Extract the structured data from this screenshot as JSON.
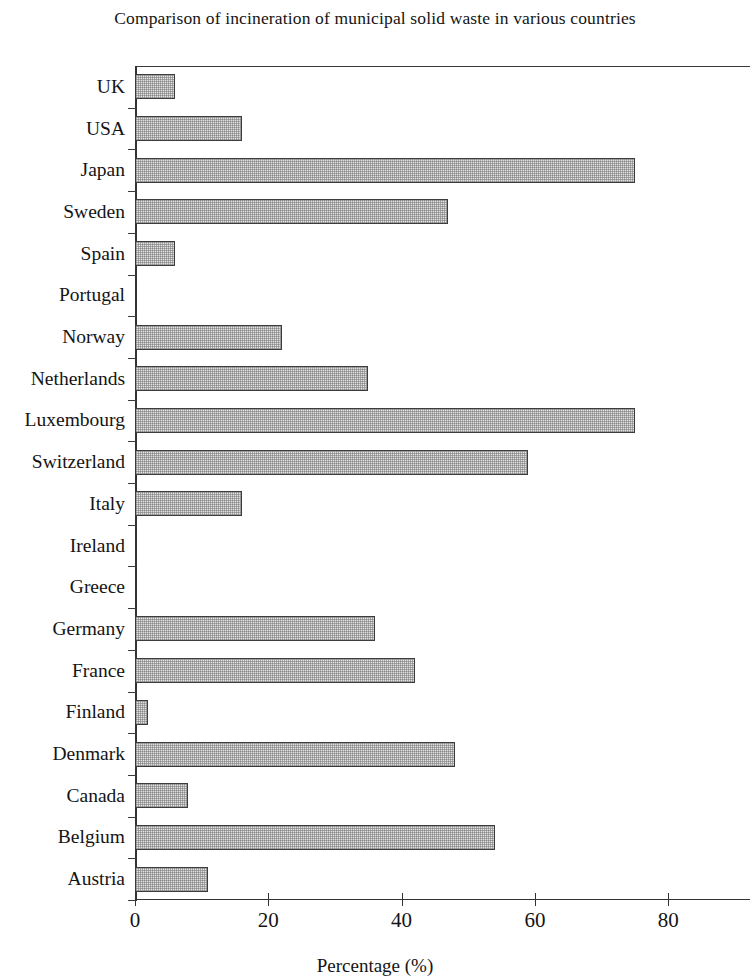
{
  "chart_data": {
    "type": "bar",
    "orientation": "horizontal",
    "title": "Comparison of incineration of municipal solid waste in various countries",
    "xlabel": "Percentage (%)",
    "ylabel": "",
    "xlim": [
      0,
      92
    ],
    "xticks": [
      0,
      20,
      40,
      60,
      80
    ],
    "xtick_labels": [
      "0",
      "20",
      "40",
      "60",
      "80"
    ],
    "grid": false,
    "legend": false,
    "categories": [
      "UK",
      "USA",
      "Japan",
      "Sweden",
      "Spain",
      "Portugal",
      "Norway",
      "Netherlands",
      "Luxembourg",
      "Switzerland",
      "Italy",
      "Ireland",
      "Greece",
      "Germany",
      "France",
      "Finland",
      "Denmark",
      "Canada",
      "Belgium",
      "Austria"
    ],
    "values": [
      6,
      16,
      75,
      47,
      6,
      0,
      22,
      35,
      75,
      59,
      16,
      0,
      0,
      36,
      42,
      2,
      48,
      8,
      54,
      11
    ],
    "bar_fill_color": "#e2e2e2",
    "bar_edge_color": "#3c3c3c",
    "axis_color": "#333333"
  }
}
